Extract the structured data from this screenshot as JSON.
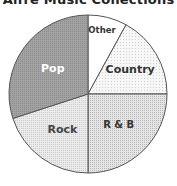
{
  "chart_data": {
    "type": "pie",
    "title": "Alfre Music Collections",
    "categories": [
      "Other",
      "Country",
      "R & B",
      "Rock",
      "Pop"
    ],
    "values": [
      8,
      17,
      25,
      20,
      30
    ],
    "unit": "percent (estimated from slice angles)",
    "start_angle_deg": 0,
    "direction": "clockwise",
    "colors": [
      "#ffffff",
      "#f3f3f3",
      "#d9d9d9",
      "#e2e2e2",
      "#9a9a9a"
    ],
    "label_colors": [
      "#333333",
      "#333333",
      "#333333",
      "#444444",
      "#ffffff"
    ],
    "legend": "none (labels inside slices)"
  }
}
